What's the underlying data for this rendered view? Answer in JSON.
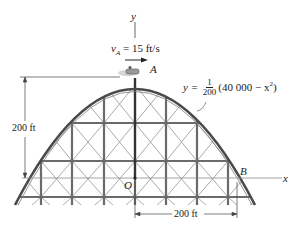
{
  "diagram": {
    "axes": {
      "y_label": "y",
      "x_label": "x",
      "origin_label": "O"
    },
    "points": {
      "A": "A",
      "B": "B"
    },
    "velocity": {
      "symbol": "v",
      "subscript": "A",
      "text": " = 15 ft/s",
      "value": 15,
      "units": "ft/s"
    },
    "equation": {
      "lhs": "y = ",
      "frac_num": "1",
      "frac_den": "200",
      "rhs_pre": "(40 000 − x",
      "rhs_exp": "2",
      "rhs_post": ")"
    },
    "dimensions": {
      "height_label": "200 ft",
      "half_span_label": "200 ft"
    },
    "colors": {
      "track": "#4a4a4a",
      "frame": "#6a6a6a",
      "brace": "#9a9a9a",
      "axis": "#8a8a8a",
      "text": "#222222"
    }
  }
}
